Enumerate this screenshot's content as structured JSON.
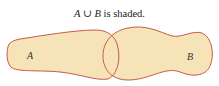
{
  "caption": {
    "set_a": "A",
    "union_symbol": "∪",
    "set_b": "B",
    "rest": " is shaded."
  },
  "diagram": {
    "type": "venn-union",
    "sets": [
      {
        "label": "A",
        "shaded": true
      },
      {
        "label": "B",
        "shaded": true
      }
    ],
    "fill_color": "#f6e3b8",
    "stroke_color": "#c65a4b"
  }
}
